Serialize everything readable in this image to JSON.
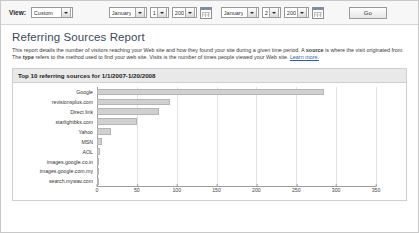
{
  "toolbar": {
    "view_label": "View:",
    "view_value": "Custom",
    "start_month": "January",
    "start_day": "1",
    "start_year": "2007",
    "end_month": "January",
    "end_day": "20",
    "end_year": "2008",
    "calendar_icon": "calendar-icon",
    "go_label": "Go"
  },
  "report": {
    "title": "Referring Sources Report",
    "description_part1": "This report details the number of visitors reaching your Web site and how they found your site during a given time period. A ",
    "description_source": "source",
    "description_part2": " is where the visit originated from. The ",
    "description_type": "type",
    "description_part3": " refers to the method used to find your web site. Visits is the number of times people viewed your Web site. ",
    "learn_more": "Learn more."
  },
  "panel": {
    "header": "Top 10 referring sources for 1/1/2007-1/20/2008"
  },
  "chart_data": {
    "type": "bar",
    "orientation": "horizontal",
    "title": "Top 10 referring sources for 1/1/2007-1/20/2008",
    "xlabel": "",
    "ylabel": "",
    "categories": [
      "Google",
      "revisionsplus.com",
      "Direct link",
      "starlightbks.com",
      "Yahoo",
      "MSN",
      "AOL",
      "images.google.co.in",
      "images.google.com.my",
      "search.mywav.com"
    ],
    "values": [
      285,
      92,
      78,
      50,
      18,
      6,
      4,
      2,
      2,
      2
    ],
    "xlim": [
      0,
      350
    ],
    "xticks": [
      0,
      50,
      100,
      150,
      200,
      250,
      300,
      350
    ],
    "grid": true,
    "legend": false,
    "bar_color": "#d0d0d0"
  }
}
